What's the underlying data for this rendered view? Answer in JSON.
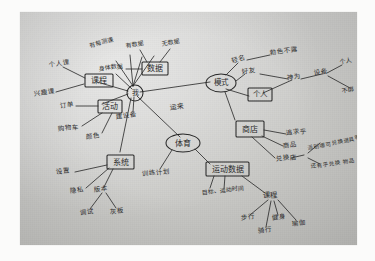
{
  "image": {
    "kind": "photograph-of-handwritten-mind-map",
    "medium": "pen on gray paper",
    "language": "Chinese",
    "paper_color": "#cbcbc8",
    "ink_color": "#2b2b2b",
    "border_color": "#ffffff"
  },
  "mindmap": {
    "center": {
      "label": "我",
      "shape": "circle"
    },
    "nodes": [
      {
        "id": "kecheng",
        "label": "课程",
        "shape": "rect"
      },
      {
        "id": "shuju",
        "label": "数据",
        "shape": "rect"
      },
      {
        "id": "huodong",
        "label": "活动",
        "shape": "rect"
      },
      {
        "id": "xitong",
        "label": "系统",
        "shape": "rect"
      },
      {
        "id": "moshi",
        "label": "模式",
        "shape": "oval"
      },
      {
        "id": "geren",
        "label": "个人",
        "shape": "rect"
      },
      {
        "id": "shangdian",
        "label": "商店",
        "shape": "rect"
      },
      {
        "id": "tiyu",
        "label": "体育",
        "shape": "oval"
      },
      {
        "id": "yundongshuju",
        "label": "运动数据",
        "shape": "rect"
      }
    ],
    "leaves": [
      {
        "id": "gerenke",
        "label": "个人课",
        "parent": "kecheng"
      },
      {
        "id": "xingquke",
        "label": "兴趣课",
        "parent": "kecheng"
      },
      {
        "id": "meiyoucedian",
        "label": "有每测课",
        "parent": "shuju"
      },
      {
        "id": "youshuju",
        "label": "有数据",
        "parent": "shuju"
      },
      {
        "id": "wushuju",
        "label": "无数据",
        "parent": "shuju"
      },
      {
        "id": "shentishuju",
        "label": "身体数据",
        "parent": "shuju"
      },
      {
        "id": "dingdan",
        "label": "订单",
        "parent": "huodong"
      },
      {
        "id": "gouwuche",
        "label": "购物车",
        "parent": "huodong"
      },
      {
        "id": "yanse",
        "label": "颜色",
        "parent": "huodong"
      },
      {
        "id": "jianshenfang",
        "label": "建设备",
        "parent": "center"
      },
      {
        "id": "shezhi",
        "label": "设置",
        "parent": "xitong"
      },
      {
        "id": "yinsi",
        "label": "隐私",
        "parent": "xitong"
      },
      {
        "id": "banben",
        "label": "版本",
        "parent": "xitong"
      },
      {
        "id": "tiaoshi",
        "label": "调试",
        "parent": "banben"
      },
      {
        "id": "huiban",
        "label": "灰板",
        "parent": "banben"
      },
      {
        "id": "qinming",
        "label": "轻名",
        "parent": "moshi"
      },
      {
        "id": "quanbuzhezhao",
        "label": "勃色不露",
        "parent": "qinming"
      },
      {
        "id": "haoshi",
        "label": "好友",
        "parent": "moshi"
      },
      {
        "id": "shenwei",
        "label": "神为",
        "parent": "haoshi"
      },
      {
        "id": "shebei",
        "label": "设备",
        "parent": "shenwei"
      },
      {
        "id": "gerenleaf",
        "label": "个人",
        "parent": "shebei"
      },
      {
        "id": "bubang",
        "label": "不绑",
        "parent": "shebei"
      },
      {
        "id": "zhuiqiuping",
        "label": "追求乎",
        "parent": "shangdian"
      },
      {
        "id": "shangpin",
        "label": "商品",
        "parent": "shangdian"
      },
      {
        "id": "duihuandian",
        "label": "兑换店",
        "parent": "shangdian"
      },
      {
        "id": "note1",
        "label": "派别哪可兑换道具等",
        "parent": "duihuandian"
      },
      {
        "id": "note2",
        "label": "还有乎兑换 物品",
        "parent": "duihuandian"
      },
      {
        "id": "xunlianjihua",
        "label": "训练计划",
        "parent": "tiyu"
      },
      {
        "id": "mubiao",
        "label": "目标、运动时间",
        "parent": "yundongshuju"
      },
      {
        "id": "kecheng2",
        "label": "课程",
        "parent": "yundongshuju"
      },
      {
        "id": "buxing",
        "label": "步行",
        "parent": "kecheng2"
      },
      {
        "id": "qixing",
        "label": "骑行",
        "parent": "kecheng2"
      },
      {
        "id": "jianshen",
        "label": "健身",
        "parent": "kecheng2"
      },
      {
        "id": "yujia",
        "label": "瑜伽",
        "parent": "kecheng2"
      }
    ],
    "edge_labels": [
      {
        "id": "edge-center-moshi",
        "label": "运来"
      }
    ]
  }
}
